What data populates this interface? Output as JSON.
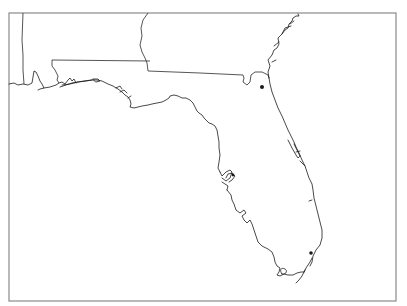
{
  "map": {
    "region": "Florida",
    "frame": {
      "x": 9,
      "y": 13,
      "width": 387,
      "height": 288,
      "color": "#8a8a8a"
    },
    "line_color": "#1a1a1a",
    "background": "#ffffff",
    "features": [
      {
        "name": "florida-coastline",
        "type": "coastline"
      },
      {
        "name": "georgia-florida-border",
        "type": "state-border"
      },
      {
        "name": "alabama-florida-border",
        "type": "state-border"
      },
      {
        "name": "alabama-georgia-border",
        "type": "state-border"
      },
      {
        "name": "mississippi-alabama-border",
        "type": "state-border"
      }
    ],
    "markers": [
      {
        "name": "city-marker-north",
        "x": 262,
        "y": 87,
        "r": 2
      },
      {
        "name": "city-marker-south",
        "x": 311,
        "y": 253,
        "r": 1.8
      },
      {
        "name": "city-marker-tampa",
        "x": 233,
        "y": 175,
        "r": 1.6
      }
    ]
  }
}
